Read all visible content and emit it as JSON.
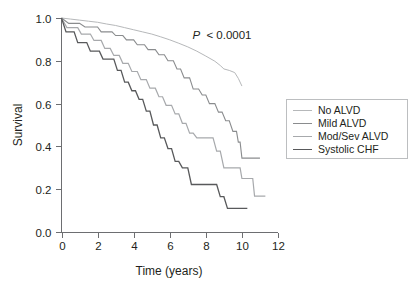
{
  "chart_data": {
    "type": "line",
    "title": "",
    "subtitle": "",
    "xlabel": "Time (years)",
    "ylabel": "Survival",
    "xlim": [
      0,
      12
    ],
    "ylim": [
      0,
      1.0
    ],
    "xticks": [
      "0",
      "2",
      "4",
      "6",
      "8",
      "10",
      "12"
    ],
    "xtick_values": [
      0,
      2,
      4,
      6,
      8,
      10,
      12
    ],
    "yticks": [
      "0.0",
      "0.2",
      "0.4",
      "0.6",
      "0.8",
      "1.0"
    ],
    "ytick_values": [
      0.0,
      0.2,
      0.4,
      0.6,
      0.8,
      1.0
    ],
    "grid": false,
    "legend_position": "right",
    "annotation": {
      "text_italic": "P",
      "text": " < 0.0001",
      "x": 7.3,
      "y": 0.925
    },
    "series": [
      {
        "name": "No ALVD",
        "color": "#b6b8ba",
        "stroke_width": 1.0,
        "points": [
          [
            0.0,
            1.0
          ],
          [
            0.5,
            0.995
          ],
          [
            1.0,
            0.99
          ],
          [
            1.5,
            0.985
          ],
          [
            2.0,
            0.98
          ],
          [
            2.5,
            0.972
          ],
          [
            3.0,
            0.965
          ],
          [
            3.5,
            0.955
          ],
          [
            4.0,
            0.945
          ],
          [
            4.5,
            0.935
          ],
          [
            5.0,
            0.925
          ],
          [
            5.5,
            0.912
          ],
          [
            6.0,
            0.898
          ],
          [
            6.5,
            0.882
          ],
          [
            7.0,
            0.865
          ],
          [
            7.5,
            0.845
          ],
          [
            8.0,
            0.822
          ],
          [
            8.5,
            0.798
          ],
          [
            8.8,
            0.778
          ],
          [
            9.0,
            0.762
          ],
          [
            9.3,
            0.755
          ],
          [
            9.6,
            0.745
          ],
          [
            9.8,
            0.718
          ],
          [
            10.0,
            0.682
          ]
        ]
      },
      {
        "name": "Mild ALVD",
        "color": "#8a8c8e",
        "stroke_width": 1.1,
        "points": [
          [
            0.0,
            1.0
          ],
          [
            0.4,
            0.975
          ],
          [
            1.0,
            0.975
          ],
          [
            1.3,
            0.958
          ],
          [
            2.0,
            0.958
          ],
          [
            2.2,
            0.935
          ],
          [
            2.8,
            0.935
          ],
          [
            3.0,
            0.918
          ],
          [
            3.4,
            0.918
          ],
          [
            3.6,
            0.898
          ],
          [
            4.0,
            0.898
          ],
          [
            4.2,
            0.875
          ],
          [
            4.6,
            0.875
          ],
          [
            4.8,
            0.852
          ],
          [
            5.2,
            0.852
          ],
          [
            5.4,
            0.828
          ],
          [
            5.7,
            0.828
          ],
          [
            5.9,
            0.8
          ],
          [
            6.2,
            0.8
          ],
          [
            6.4,
            0.762
          ],
          [
            6.6,
            0.762
          ],
          [
            6.8,
            0.72
          ],
          [
            7.1,
            0.72
          ],
          [
            7.3,
            0.668
          ],
          [
            7.6,
            0.668
          ],
          [
            7.8,
            0.64
          ],
          [
            8.0,
            0.64
          ],
          [
            8.2,
            0.6
          ],
          [
            8.5,
            0.6
          ],
          [
            8.7,
            0.56
          ],
          [
            8.9,
            0.56
          ],
          [
            9.1,
            0.52
          ],
          [
            9.3,
            0.52
          ],
          [
            9.5,
            0.47
          ],
          [
            9.7,
            0.47
          ],
          [
            9.8,
            0.42
          ],
          [
            9.9,
            0.42
          ],
          [
            10.0,
            0.345
          ],
          [
            11.0,
            0.345
          ]
        ]
      },
      {
        "name": "Mod/Sev ALVD",
        "color": "#a7a9ac",
        "stroke_width": 1.2,
        "points": [
          [
            0.0,
            1.0
          ],
          [
            0.3,
            0.955
          ],
          [
            0.9,
            0.955
          ],
          [
            1.1,
            0.925
          ],
          [
            1.6,
            0.925
          ],
          [
            1.8,
            0.895
          ],
          [
            2.2,
            0.895
          ],
          [
            2.4,
            0.858
          ],
          [
            2.7,
            0.858
          ],
          [
            2.9,
            0.825
          ],
          [
            3.2,
            0.825
          ],
          [
            3.4,
            0.788
          ],
          [
            3.7,
            0.788
          ],
          [
            3.9,
            0.75
          ],
          [
            4.2,
            0.75
          ],
          [
            4.4,
            0.712
          ],
          [
            4.7,
            0.712
          ],
          [
            4.9,
            0.672
          ],
          [
            5.2,
            0.672
          ],
          [
            5.4,
            0.632
          ],
          [
            5.6,
            0.632
          ],
          [
            5.8,
            0.592
          ],
          [
            6.1,
            0.592
          ],
          [
            6.3,
            0.552
          ],
          [
            6.5,
            0.552
          ],
          [
            6.7,
            0.508
          ],
          [
            6.9,
            0.508
          ],
          [
            7.1,
            0.462
          ],
          [
            7.3,
            0.462
          ],
          [
            7.5,
            0.44
          ],
          [
            8.4,
            0.44
          ],
          [
            8.6,
            0.378
          ],
          [
            8.8,
            0.378
          ],
          [
            9.0,
            0.3
          ],
          [
            9.9,
            0.3
          ],
          [
            10.0,
            0.25
          ],
          [
            10.6,
            0.25
          ],
          [
            10.7,
            0.168
          ],
          [
            11.3,
            0.168
          ]
        ]
      },
      {
        "name": "Systolic CHF",
        "color": "#58595b",
        "stroke_width": 1.3,
        "points": [
          [
            0.0,
            1.0
          ],
          [
            0.25,
            0.935
          ],
          [
            0.7,
            0.935
          ],
          [
            0.9,
            0.885
          ],
          [
            1.4,
            0.885
          ],
          [
            1.6,
            0.845
          ],
          [
            2.1,
            0.845
          ],
          [
            2.3,
            0.808
          ],
          [
            2.9,
            0.808
          ],
          [
            3.1,
            0.755
          ],
          [
            3.3,
            0.755
          ],
          [
            3.5,
            0.7
          ],
          [
            3.7,
            0.7
          ],
          [
            3.9,
            0.66
          ],
          [
            4.1,
            0.66
          ],
          [
            4.3,
            0.62
          ],
          [
            4.5,
            0.62
          ],
          [
            4.7,
            0.565
          ],
          [
            4.9,
            0.565
          ],
          [
            5.1,
            0.5
          ],
          [
            5.3,
            0.5
          ],
          [
            5.5,
            0.44
          ],
          [
            5.7,
            0.44
          ],
          [
            5.9,
            0.39
          ],
          [
            6.1,
            0.39
          ],
          [
            6.3,
            0.33
          ],
          [
            6.5,
            0.33
          ],
          [
            6.7,
            0.3
          ],
          [
            7.0,
            0.3
          ],
          [
            7.2,
            0.222
          ],
          [
            7.4,
            0.222
          ],
          [
            7.6,
            0.222
          ],
          [
            8.6,
            0.222
          ],
          [
            8.8,
            0.165
          ],
          [
            9.0,
            0.165
          ],
          [
            9.2,
            0.11
          ],
          [
            10.3,
            0.11
          ]
        ]
      }
    ],
    "legend": [
      {
        "label": "No ALVD",
        "color": "#b6b8ba"
      },
      {
        "label": "Mild ALVD",
        "color": "#8a8c8e"
      },
      {
        "label": "Mod/Sev ALVD",
        "color": "#a7a9ac"
      },
      {
        "label": "Systolic CHF",
        "color": "#58595b"
      }
    ]
  },
  "axis": {
    "x_title": "Time (years)",
    "y_title": "Survival",
    "x_tick_labels": [
      "0",
      "2",
      "4",
      "6",
      "8",
      "10",
      "12"
    ],
    "y_tick_labels": [
      "0.0",
      "0.2",
      "0.4",
      "0.6",
      "0.8",
      "1.0"
    ]
  },
  "annotation": {
    "p_symbol": "P",
    "p_text": "< 0.0001"
  },
  "legend": {
    "items": [
      {
        "label": "No ALVD"
      },
      {
        "label": "Mild ALVD"
      },
      {
        "label": "Mod/Sev ALVD"
      },
      {
        "label": "Systolic CHF"
      }
    ]
  }
}
